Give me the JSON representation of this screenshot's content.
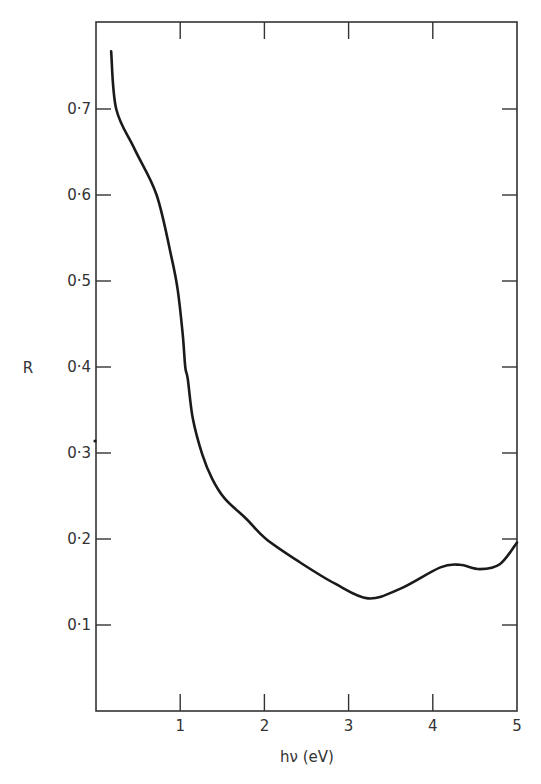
{
  "chart_data": {
    "type": "line",
    "title": "",
    "xlabel": "hν (eV)",
    "ylabel": "R",
    "xlim": [
      0,
      5
    ],
    "ylim": [
      0,
      0.8
    ],
    "grid": false,
    "legend": null,
    "x_ticks": [
      {
        "value": 1,
        "label": "1"
      },
      {
        "value": 2,
        "label": "2"
      },
      {
        "value": 3,
        "label": "3"
      },
      {
        "value": 4,
        "label": "4"
      },
      {
        "value": 5,
        "label": "5"
      }
    ],
    "y_ticks": [
      {
        "value": 0.1,
        "label": "0·1"
      },
      {
        "value": 0.2,
        "label": "0·2"
      },
      {
        "value": 0.3,
        "label": "0·3"
      },
      {
        "value": 0.4,
        "label": "0·4"
      },
      {
        "value": 0.5,
        "label": "0·5"
      },
      {
        "value": 0.6,
        "label": "0·6"
      },
      {
        "value": 0.7,
        "label": "0·7"
      }
    ],
    "series": [
      {
        "name": "R",
        "x": [
          0.18,
          0.24,
          0.46,
          0.72,
          0.9,
          0.97,
          1.03,
          1.06,
          1.09,
          1.15,
          1.26,
          1.38,
          1.53,
          1.79,
          2.02,
          2.42,
          2.84,
          3.23,
          3.61,
          4.09,
          4.32,
          4.56,
          4.8,
          5.0
        ],
        "values": [
          0.767,
          0.7,
          0.653,
          0.6,
          0.526,
          0.49,
          0.438,
          0.4,
          0.386,
          0.34,
          0.299,
          0.27,
          0.247,
          0.223,
          0.2,
          0.173,
          0.148,
          0.131,
          0.142,
          0.167,
          0.17,
          0.165,
          0.171,
          0.196
        ]
      }
    ]
  }
}
